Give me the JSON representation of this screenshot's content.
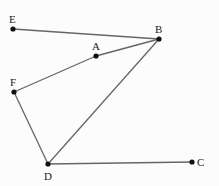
{
  "diagram": {
    "points": {
      "E": {
        "label": "E",
        "x": 13,
        "y": 29
      },
      "B": {
        "label": "B",
        "x": 159,
        "y": 39
      },
      "A": {
        "label": "A",
        "x": 96,
        "y": 56
      },
      "F": {
        "label": "F",
        "x": 14,
        "y": 92
      },
      "D": {
        "label": "D",
        "x": 48,
        "y": 164
      },
      "C": {
        "label": "C",
        "x": 192,
        "y": 162
      }
    },
    "segments": [
      [
        "E",
        "B"
      ],
      [
        "F",
        "A"
      ],
      [
        "A",
        "B"
      ],
      [
        "F",
        "D"
      ],
      [
        "D",
        "B"
      ],
      [
        "D",
        "C"
      ]
    ]
  }
}
